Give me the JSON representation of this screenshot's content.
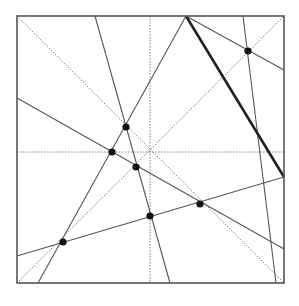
{
  "diagram": {
    "type": "origami-crease-pattern",
    "square": {
      "x": 17,
      "y": 16,
      "size": 267
    },
    "colors": {
      "line": "#555555",
      "thick": "#222222",
      "dotted": "#777777",
      "point": "#111111"
    },
    "dotted_lines": [
      {
        "x1": 150,
        "y1": 16,
        "x2": 150,
        "y2": 283
      },
      {
        "x1": 17,
        "y1": 152,
        "x2": 284,
        "y2": 152
      },
      {
        "x1": 17,
        "y1": 16,
        "x2": 284,
        "y2": 283
      },
      {
        "x1": 17,
        "y1": 283,
        "x2": 284,
        "y2": 16
      }
    ],
    "solid_lines": [
      {
        "x1": 186,
        "y1": 16,
        "x2": 38,
        "y2": 283
      },
      {
        "x1": 95,
        "y1": 16,
        "x2": 170,
        "y2": 283
      },
      {
        "x1": 243,
        "y1": 16,
        "x2": 276,
        "y2": 283
      },
      {
        "x1": 186,
        "y1": 16,
        "x2": 284,
        "y2": 70
      },
      {
        "x1": 17,
        "y1": 98,
        "x2": 284,
        "y2": 249
      },
      {
        "x1": 17,
        "y1": 256,
        "x2": 284,
        "y2": 177
      }
    ],
    "thick_lines": [
      {
        "x1": 186,
        "y1": 16,
        "x2": 284,
        "y2": 177
      }
    ],
    "points": [
      {
        "x": 126,
        "y": 127
      },
      {
        "x": 112,
        "y": 152
      },
      {
        "x": 136,
        "y": 167
      },
      {
        "x": 150,
        "y": 216
      },
      {
        "x": 200,
        "y": 204
      },
      {
        "x": 63,
        "y": 242
      },
      {
        "x": 248,
        "y": 51
      }
    ]
  }
}
